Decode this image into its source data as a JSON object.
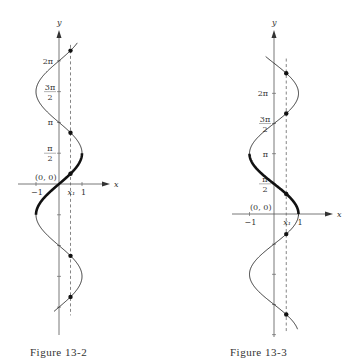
{
  "figures": [
    {
      "id": "fig-13-2",
      "caption": "Figure 13-2",
      "function": "x = sin y",
      "bold_branch": "y in [-π/2, π/2]",
      "x_axis_label": "x",
      "y_axis_label": "y",
      "origin_label": "(0, 0)",
      "x_ticks": [
        {
          "value": -1,
          "label": "−1"
        },
        {
          "value": 1,
          "label": "1"
        }
      ],
      "x1_label": "x₁",
      "x1_value": 0.5,
      "y_ticks": [
        {
          "value": 1.5708,
          "num": "π",
          "den": "2"
        },
        {
          "value": 3.1416,
          "label": "π"
        },
        {
          "value": 4.7124,
          "num": "3π",
          "den": "2"
        },
        {
          "value": 6.2832,
          "label": "2π"
        },
        {
          "value": -1.5708
        },
        {
          "value": -3.1416
        },
        {
          "value": -4.7124
        },
        {
          "value": -6.2832
        }
      ],
      "y_range": [
        -6.5,
        7.2
      ],
      "bold_range": [
        -1.5708,
        1.5708
      ],
      "dots_y": [
        0.5236,
        2.618,
        6.8068,
        -3.6652,
        -5.7596
      ]
    },
    {
      "id": "fig-13-3",
      "caption": "Figure 13-3",
      "function": "x = cos y",
      "bold_branch": "y in [0, π]",
      "x_axis_label": "x",
      "y_axis_label": "y",
      "origin_label": "(0, 0)",
      "x_ticks": [
        {
          "value": -1,
          "label": "−1"
        },
        {
          "value": 1,
          "label": "1"
        }
      ],
      "x1_label": "x₁",
      "x1_value": 0.5,
      "y_ticks": [
        {
          "value": 1.5708,
          "num": "π",
          "den": "2"
        },
        {
          "value": 3.1416,
          "label": "π"
        },
        {
          "value": 4.7124,
          "num": "3π",
          "den": "2"
        },
        {
          "value": 6.2832,
          "label": "2π"
        },
        {
          "value": -1.5708
        },
        {
          "value": -3.1416
        },
        {
          "value": -4.7124
        },
        {
          "value": -6.2832
        }
      ],
      "y_range": [
        -6.0,
        8.2
      ],
      "bold_range": [
        0,
        3.1416
      ],
      "dots_y": [
        1.0472,
        5.236,
        7.3304,
        -1.0472,
        -5.236
      ]
    }
  ]
}
